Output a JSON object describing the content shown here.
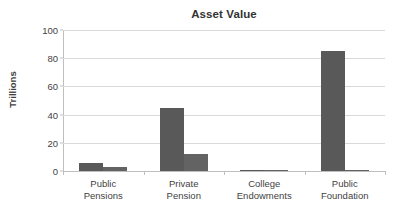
{
  "chart_data": {
    "type": "bar",
    "title": "Asset Value",
    "xlabel": "",
    "ylabel": "Trillions",
    "ylim": [
      0,
      100
    ],
    "yticks": [
      0,
      20,
      40,
      60,
      80,
      100
    ],
    "ytick_labels": [
      "0",
      "20",
      "40",
      "60",
      "80",
      "100"
    ],
    "grid": true,
    "legend": "none",
    "categories": [
      "Public Pensions",
      "Private Pension",
      "College Endowments",
      "Public Foundation"
    ],
    "category_lines": [
      [
        "Public",
        "Pensions"
      ],
      [
        "Private",
        "Pension"
      ],
      [
        "College",
        "Endowments"
      ],
      [
        "Public",
        "Foundation"
      ]
    ],
    "series": [
      {
        "name": "Series 1",
        "color": "#595959",
        "values": [
          6,
          45,
          0.6,
          85
        ]
      },
      {
        "name": "Series 2",
        "color": "#636363",
        "values": [
          2.5,
          12,
          0.1,
          0.3
        ]
      }
    ]
  },
  "style": {
    "bar_color": "#595959",
    "bar_color_2": "#636363",
    "grid_color": "#d9d9d9",
    "axis_color": "#bfbfbf",
    "background": "#ffffff",
    "text_color": "#3f3f3f"
  }
}
